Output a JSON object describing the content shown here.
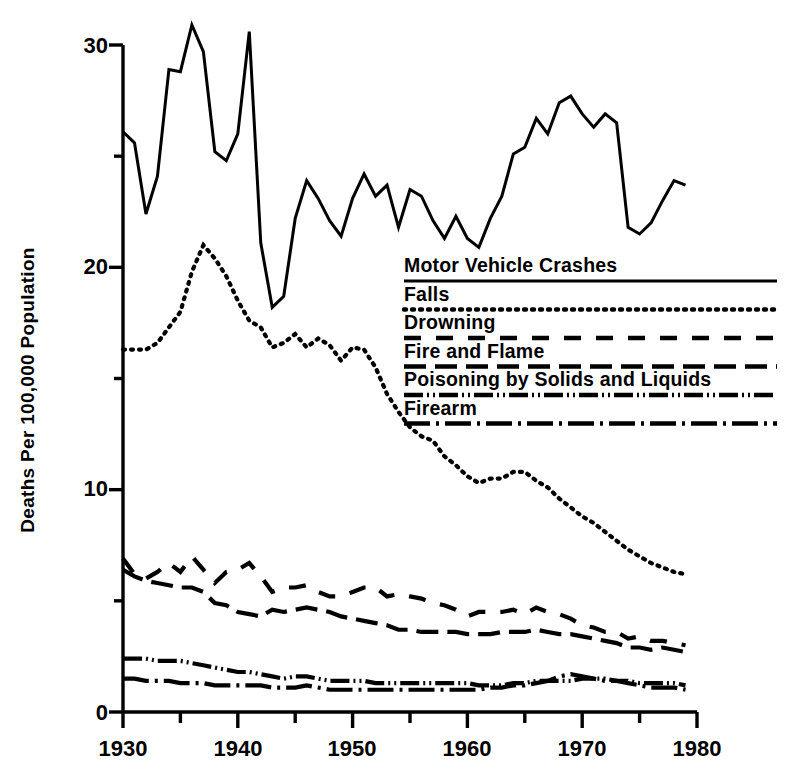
{
  "chart_data": {
    "type": "line",
    "title": "",
    "xlabel": "",
    "ylabel": "Deaths Per 100,000 Population",
    "xlim": [
      1930,
      1980
    ],
    "ylim": [
      0,
      30
    ],
    "xticks": [
      1930,
      1940,
      1950,
      1960,
      1970,
      1980
    ],
    "xtick_labels": [
      "1930",
      "1940",
      "1950",
      "1960",
      "1970",
      "1980"
    ],
    "xminorticks": [
      1935,
      1945,
      1955,
      1965,
      1975
    ],
    "yticks": [
      0,
      10,
      20,
      30
    ],
    "ytick_labels": [
      "0",
      "10",
      "20",
      "30"
    ],
    "yminorticks": [
      5,
      15,
      25
    ],
    "grid": false,
    "legend_position": "center-right inside plot",
    "x": [
      1930,
      1931,
      1932,
      1933,
      1934,
      1935,
      1936,
      1937,
      1938,
      1939,
      1940,
      1941,
      1942,
      1943,
      1944,
      1945,
      1946,
      1947,
      1948,
      1949,
      1950,
      1951,
      1952,
      1953,
      1954,
      1955,
      1956,
      1957,
      1958,
      1959,
      1960,
      1961,
      1962,
      1963,
      1964,
      1965,
      1966,
      1967,
      1968,
      1969,
      1970,
      1971,
      1972,
      1973,
      1974,
      1975,
      1976,
      1977,
      1978,
      1979
    ],
    "series": [
      {
        "name": "Motor Vehicle Crashes",
        "style": "solid",
        "values": [
          26.1,
          25.6,
          22.4,
          24.1,
          28.9,
          28.8,
          30.9,
          29.7,
          25.2,
          24.8,
          26.0,
          30.6,
          21.1,
          18.2,
          18.7,
          22.2,
          23.9,
          23.1,
          22.1,
          21.4,
          23.1,
          24.2,
          23.2,
          23.7,
          21.8,
          23.5,
          23.2,
          22.1,
          21.3,
          22.3,
          21.3,
          20.9,
          22.2,
          23.2,
          25.1,
          25.4,
          26.7,
          26.0,
          27.4,
          27.7,
          26.9,
          26.3,
          26.9,
          26.5,
          21.8,
          21.5,
          22.0,
          23.0,
          23.9,
          23.7
        ]
      },
      {
        "name": "Falls",
        "style": "dotted",
        "values": [
          16.3,
          16.3,
          16.3,
          16.6,
          17.3,
          18.0,
          19.8,
          21.0,
          20.4,
          19.6,
          18.5,
          17.6,
          17.3,
          16.4,
          16.6,
          17.0,
          16.4,
          16.8,
          16.5,
          15.8,
          16.4,
          16.3,
          15.5,
          14.3,
          13.5,
          12.8,
          12.4,
          12.2,
          11.5,
          11.1,
          10.6,
          10.3,
          10.5,
          10.5,
          10.8,
          10.8,
          10.4,
          10.1,
          9.6,
          9.2,
          8.8,
          8.5,
          8.1,
          7.7,
          7.3,
          7.0,
          6.7,
          6.5,
          6.3,
          6.2
        ]
      },
      {
        "name": "Drowning",
        "style": "long-dash",
        "values": [
          6.9,
          6.2,
          6.0,
          6.3,
          6.7,
          6.3,
          7.0,
          6.4,
          5.8,
          6.3,
          6.4,
          6.7,
          6.1,
          5.4,
          5.6,
          5.6,
          5.7,
          5.4,
          5.2,
          5.2,
          5.4,
          5.6,
          5.6,
          5.2,
          5.3,
          5.2,
          5.1,
          4.9,
          4.8,
          4.6,
          4.3,
          4.5,
          4.5,
          4.5,
          4.6,
          4.4,
          4.7,
          4.5,
          4.4,
          4.2,
          3.9,
          3.8,
          3.6,
          3.6,
          3.3,
          3.4,
          3.2,
          3.2,
          3.1,
          3.0
        ]
      },
      {
        "name": "Fire and Flame",
        "style": "dash",
        "values": [
          6.4,
          6.1,
          5.9,
          5.8,
          5.7,
          5.6,
          5.6,
          5.4,
          4.9,
          4.8,
          4.5,
          4.4,
          4.3,
          4.6,
          4.5,
          4.6,
          4.7,
          4.6,
          4.5,
          4.3,
          4.2,
          4.1,
          4.0,
          3.9,
          3.7,
          3.7,
          3.6,
          3.6,
          3.6,
          3.6,
          3.5,
          3.5,
          3.5,
          3.6,
          3.6,
          3.6,
          3.7,
          3.6,
          3.5,
          3.5,
          3.4,
          3.3,
          3.2,
          3.1,
          2.9,
          2.9,
          2.8,
          2.9,
          2.8,
          2.7
        ]
      },
      {
        "name": "Poisoning by Solids and Liquids",
        "style": "dash-dot-dot",
        "values": [
          2.4,
          2.4,
          2.4,
          2.3,
          2.3,
          2.3,
          2.2,
          2.1,
          2.0,
          1.9,
          1.8,
          1.8,
          1.7,
          1.6,
          1.5,
          1.6,
          1.6,
          1.5,
          1.4,
          1.4,
          1.4,
          1.4,
          1.3,
          1.3,
          1.3,
          1.3,
          1.3,
          1.3,
          1.3,
          1.3,
          1.3,
          1.2,
          1.2,
          1.2,
          1.3,
          1.3,
          1.4,
          1.4,
          1.4,
          1.4,
          1.5,
          1.5,
          1.5,
          1.4,
          1.4,
          1.3,
          1.3,
          1.3,
          1.3,
          1.2
        ]
      },
      {
        "name": "Firearm",
        "style": "dash-dot",
        "values": [
          1.5,
          1.5,
          1.4,
          1.4,
          1.4,
          1.3,
          1.3,
          1.3,
          1.2,
          1.2,
          1.2,
          1.2,
          1.2,
          1.1,
          1.1,
          1.1,
          1.2,
          1.1,
          1.0,
          1.0,
          1.0,
          1.0,
          1.0,
          1.0,
          1.0,
          1.0,
          1.0,
          1.0,
          1.0,
          1.0,
          1.0,
          1.0,
          1.1,
          1.1,
          1.2,
          1.2,
          1.3,
          1.4,
          1.6,
          1.7,
          1.6,
          1.5,
          1.4,
          1.4,
          1.3,
          1.2,
          1.1,
          1.1,
          1.1,
          1.0
        ]
      }
    ]
  },
  "axis": {
    "ylabel": "Deaths Per 100,000 Population",
    "ytick_0": "0",
    "ytick_10": "10",
    "ytick_20": "20",
    "ytick_30": "30",
    "xtick_1930": "1930",
    "xtick_1940": "1940",
    "xtick_1950": "1950",
    "xtick_1960": "1960",
    "xtick_1970": "1970",
    "xtick_1980": "1980"
  },
  "legend": {
    "items": [
      {
        "label": "Motor Vehicle Crashes",
        "style": "solid"
      },
      {
        "label": "Falls",
        "style": "dotted"
      },
      {
        "label": "Drowning",
        "style": "long-dash"
      },
      {
        "label": "Fire and Flame",
        "style": "dash"
      },
      {
        "label": "Poisoning by Solids and Liquids",
        "style": "dash-dot-dot"
      },
      {
        "label": "Firearm",
        "style": "dash-dot"
      }
    ]
  },
  "colors": {
    "ink": "#000000",
    "background": "#ffffff"
  }
}
